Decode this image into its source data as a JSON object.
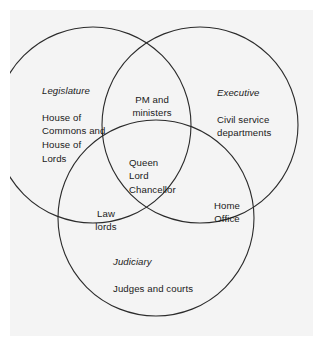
{
  "diagram": {
    "type": "venn",
    "set_count": 3,
    "background_color": "#f4f4f4",
    "stroke_color": "#2b2b2b",
    "text_color": "#1a1a1a",
    "circles": [
      {
        "id": "legislature",
        "cx": 83,
        "cy": 115,
        "r": 98
      },
      {
        "id": "executive",
        "cx": 190,
        "cy": 115,
        "r": 98
      },
      {
        "id": "judiciary",
        "cx": 146,
        "cy": 208,
        "r": 98
      }
    ],
    "regions": {
      "legislature": {
        "title": "Legislature",
        "body": "House of\nCommons and\nHouse of\nLords"
      },
      "executive": {
        "title": "Executive",
        "body": "Civil service\ndepartments"
      },
      "judiciary": {
        "title": "Judiciary",
        "body": "Judges and courts"
      },
      "legislature_executive": {
        "body": "PM and\nministers"
      },
      "legislature_judiciary": {
        "body": "Law\nlords"
      },
      "executive_judiciary": {
        "body": "Home\nOffice"
      },
      "all_three": {
        "body": "Queen\nLord\nChancellor"
      }
    }
  }
}
